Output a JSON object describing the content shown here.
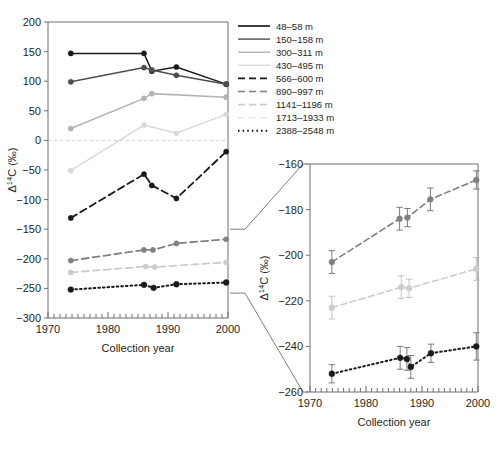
{
  "figure": {
    "main_axis": {
      "xlabel": "Collection year",
      "ylabel": "Δ1⁴C (‰)",
      "ylabel_delta": "Δ",
      "ylabel_sup": "14",
      "ylabel_rest": "C (‰)",
      "xlim": [
        1970,
        2000
      ],
      "ylim": [
        -300,
        200
      ],
      "xticks": [
        1970,
        1980,
        1990,
        2000
      ],
      "yticks": [
        200,
        150,
        100,
        50,
        0,
        -50,
        -100,
        -150,
        -200,
        -250,
        -300
      ],
      "xtick_labels": [
        "1970",
        "1980",
        "1990",
        "2000"
      ],
      "ytick_labels": [
        "200",
        "150",
        "100",
        "50",
        "0",
        "−50",
        "−100",
        "−150",
        "−200",
        "−250",
        "−300"
      ]
    },
    "inset_axis": {
      "xlabel": "Collection year",
      "ylabel": "Δ1⁴C (‰)",
      "xlim": [
        1970,
        2000
      ],
      "ylim": [
        -260,
        -160
      ],
      "xticks": [
        1970,
        1980,
        1990,
        2000
      ],
      "yticks": [
        -160,
        -180,
        -200,
        -220,
        -240,
        -260
      ],
      "xtick_labels": [
        "1970",
        "1980",
        "1990",
        "2000"
      ],
      "ytick_labels": [
        "−160",
        "−180",
        "−200",
        "−220",
        "−240",
        "−260"
      ]
    },
    "legend": {
      "entries": [
        {
          "label": "48–58 m",
          "color": "#1a1a1a",
          "dash": "none",
          "width": 1.7
        },
        {
          "label": "150–158 m",
          "color": "#4d4d4d",
          "dash": "none",
          "width": 1.4
        },
        {
          "label": "300–311 m",
          "color": "#b3b3b3",
          "dash": "none",
          "width": 1.4
        },
        {
          "label": "430–495 m",
          "color": "#d9d9d9",
          "dash": "none",
          "width": 1.4
        },
        {
          "label": "566–600 m",
          "color": "#1a1a1a",
          "dash": "7,4",
          "width": 1.9
        },
        {
          "label": "890–997 m",
          "color": "#808080",
          "dash": "7,4",
          "width": 1.6
        },
        {
          "label": "1141–1196 m",
          "color": "#cccccc",
          "dash": "7,4",
          "width": 1.6
        },
        {
          "label": "1713–1933 m",
          "color": "#e8e8e8",
          "dash": "7,4",
          "width": 1.6
        },
        {
          "label": "2388–2548 m",
          "color": "#1a1a1a",
          "dash": "1.6,3",
          "width": 2.0
        }
      ]
    }
  },
  "chart_data": [
    {
      "type": "line",
      "name": "main-panel",
      "title": "",
      "xlabel": "Collection year",
      "ylabel": "Δ14C (‰)",
      "xlim": [
        1970,
        2000
      ],
      "ylim": [
        -300,
        200
      ],
      "grid": false,
      "legend_position": "right",
      "series": [
        {
          "name": "48–58 m",
          "color": "#1a1a1a",
          "style": "solid",
          "x": [
            1973.8,
            1986.0,
            1987.3,
            1991.4,
            1999.7
          ],
          "y": [
            147,
            147,
            117,
            124,
            95
          ]
        },
        {
          "name": "150–158 m",
          "color": "#4d4d4d",
          "style": "solid",
          "x": [
            1973.8,
            1986.0,
            1987.3,
            1991.4,
            1999.7
          ],
          "y": [
            99,
            123,
            119,
            110,
            95
          ]
        },
        {
          "name": "300–311 m",
          "color": "#b3b3b3",
          "style": "solid",
          "x": [
            1973.8,
            1986.0,
            1987.3,
            1999.7
          ],
          "y": [
            20,
            71,
            79,
            73
          ]
        },
        {
          "name": "430–495 m",
          "color": "#d9d9d9",
          "style": "solid",
          "x": [
            1973.8,
            1986.0,
            1991.4,
            1999.7
          ],
          "y": [
            -51,
            26,
            12,
            44
          ]
        },
        {
          "name": "566–600 m",
          "color": "#1a1a1a",
          "style": "dashed",
          "x": [
            1973.8,
            1986.0,
            1987.3,
            1991.4,
            1999.7
          ],
          "y": [
            -131,
            -57,
            -76,
            -98,
            -19
          ]
        },
        {
          "name": "890–997 m",
          "color": "#808080",
          "style": "dashed",
          "x": [
            1973.8,
            1986.0,
            1987.5,
            1991.4,
            1999.7
          ],
          "y": [
            -203,
            -185,
            -185,
            -174,
            -167
          ]
        },
        {
          "name": "1141–1196 m",
          "color": "#cccccc",
          "style": "dashed",
          "x": [
            1973.8,
            1986.3,
            1987.8,
            1999.7
          ],
          "y": [
            -223,
            -213,
            -214,
            -206
          ]
        },
        {
          "name": "2388–2548 m",
          "color": "#1a1a1a",
          "style": "dotted",
          "x": [
            1973.8,
            1986.0,
            1987.6,
            1991.4,
            1999.7
          ],
          "y": [
            -252,
            -244,
            -249,
            -243,
            -240
          ]
        }
      ]
    },
    {
      "type": "line",
      "name": "inset-panel",
      "title": "",
      "xlabel": "Collection year",
      "ylabel": "Δ14C (‰)",
      "xlim": [
        1970,
        2000
      ],
      "ylim": [
        -260,
        -160
      ],
      "grid": false,
      "legend_position": "none",
      "series": [
        {
          "name": "890–997 m",
          "color": "#808080",
          "style": "dashed",
          "x": [
            1973.9,
            1986.0,
            1987.4,
            1991.5,
            1999.7
          ],
          "y": [
            -203,
            -184,
            -183.5,
            -175.5,
            -167
          ],
          "yerr": [
            5,
            5,
            4,
            5,
            4
          ]
        },
        {
          "name": "1141–1196 m",
          "color": "#cccccc",
          "style": "dashed",
          "x": [
            1973.9,
            1986.3,
            1987.7,
            1999.7
          ],
          "y": [
            -223,
            -214,
            -214.5,
            -206
          ],
          "yerr": [
            5,
            5,
            4,
            5
          ]
        },
        {
          "name": "2388–2548 m",
          "color": "#1a1a1a",
          "style": "dotted",
          "x": [
            1973.9,
            1986.1,
            1987.3,
            1988.0,
            1991.6,
            1999.7
          ],
          "y": [
            -252,
            -245,
            -245.5,
            -249,
            -243,
            -240
          ],
          "yerr": [
            4,
            5,
            5,
            5,
            4,
            6
          ]
        }
      ]
    }
  ]
}
